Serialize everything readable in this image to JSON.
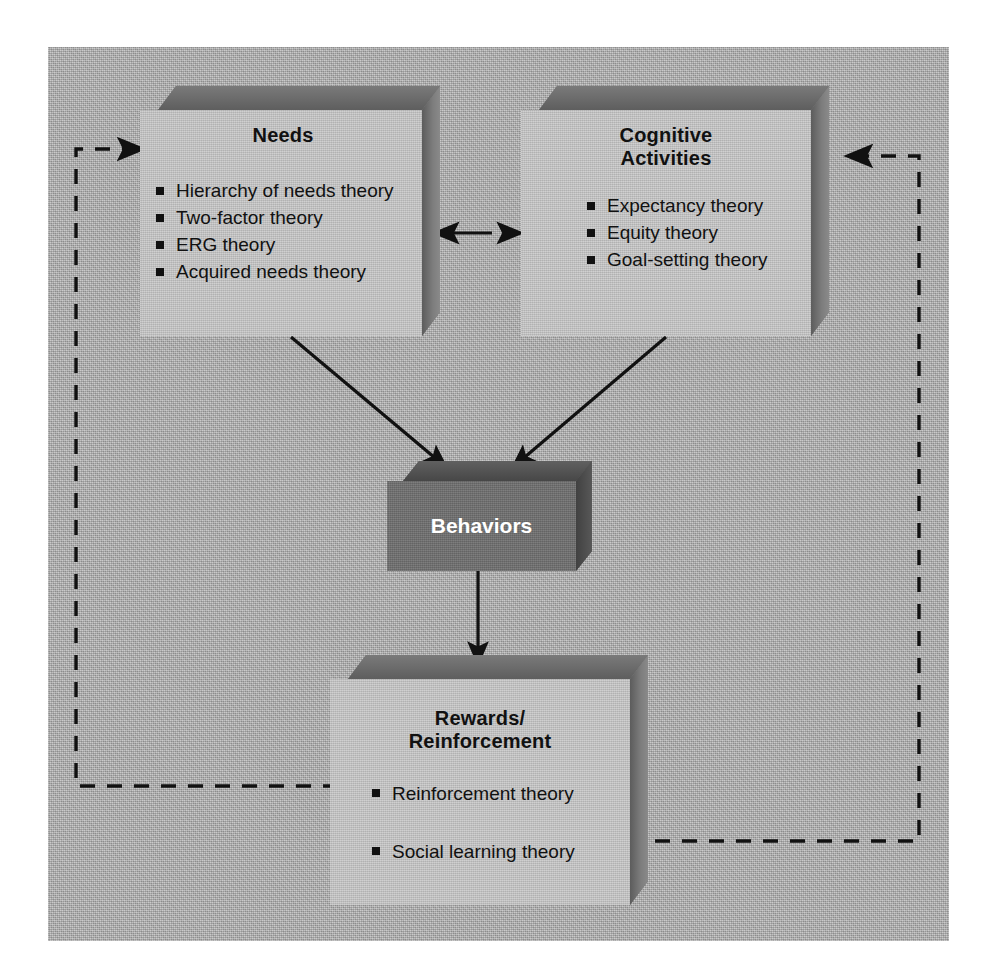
{
  "diagram": {
    "background_color": "#b4b4b4",
    "box_face_color": "#c2c2c2",
    "dark_box_color": "#6d6d6d",
    "line_color": "#111111"
  },
  "boxes": {
    "needs": {
      "title": "Needs",
      "items": [
        "Hierarchy of needs theory",
        "Two-factor theory",
        "ERG theory",
        "Acquired needs theory"
      ]
    },
    "cognitive": {
      "title": "Cognitive\nActivities",
      "items": [
        "Expectancy theory",
        "Equity theory",
        "Goal-setting theory"
      ]
    },
    "behaviors": {
      "title": "Behaviors",
      "items": []
    },
    "rewards": {
      "title": "Rewards/\nReinforcement",
      "items": [
        "Reinforcement theory",
        "Social learning theory"
      ]
    }
  },
  "connectors": [
    {
      "name": "needs-to-behaviors",
      "style": "solid",
      "arrow": "single",
      "from": "needs",
      "to": "behaviors"
    },
    {
      "name": "cognitive-to-behaviors",
      "style": "solid",
      "arrow": "single",
      "from": "cognitive",
      "to": "behaviors"
    },
    {
      "name": "behaviors-to-rewards",
      "style": "solid",
      "arrow": "single",
      "from": "behaviors",
      "to": "rewards"
    },
    {
      "name": "needs-cognitive-bidirectional",
      "style": "dashed",
      "arrow": "double",
      "from": "needs",
      "to": "cognitive"
    },
    {
      "name": "rewards-feedback-to-needs",
      "style": "dashed",
      "arrow": "single",
      "from": "rewards",
      "to": "needs"
    },
    {
      "name": "rewards-feedback-to-cognitive",
      "style": "dashed",
      "arrow": "single",
      "from": "rewards",
      "to": "cognitive"
    }
  ]
}
